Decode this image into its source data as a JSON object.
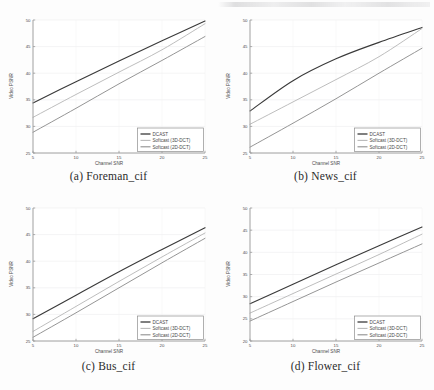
{
  "figure": {
    "type": "multi-panel-line-chart-figure",
    "panel_count": 4,
    "layout": "2x2"
  },
  "captions": {
    "a": "(a) Foreman_cif",
    "b": "(b) News_cif",
    "c": "(c) Bus_cif",
    "d": "(d) Flower_cif"
  },
  "common": {
    "xlabel": "Channel SNR",
    "ylabel": "Video PSNR",
    "xticks": [
      "5",
      "10",
      "15",
      "20",
      "25"
    ],
    "legend": [
      "DCAST",
      "Softcast (3D-DCT)",
      "Softcast (2D-DCT)"
    ]
  },
  "colors": {
    "dcast": "#3a3a3a",
    "softcast_3d": "#b9b9b9",
    "softcast_2d": "#8f8f8f",
    "axis": "#9a9a9a",
    "grid": "#e8e8ea",
    "text": "#4a4a4a",
    "caption": "#2b2b2b",
    "background": "#fdfdfd"
  },
  "chart_data": [
    {
      "type": "line",
      "panel": "a",
      "title": "(a) Foreman_cif",
      "xlabel": "Channel SNR",
      "ylabel": "Video PSNR",
      "xlim": [
        5,
        25
      ],
      "ylim": [
        25,
        50
      ],
      "xticks": [
        5,
        10,
        15,
        20,
        25
      ],
      "yticks": [
        25,
        30,
        35,
        40,
        45,
        50
      ],
      "grid": true,
      "legend_position": "lower right",
      "x": [
        5,
        10,
        15,
        20,
        25
      ],
      "series": [
        {
          "name": "DCAST",
          "values": [
            34.4,
            38.4,
            42.3,
            46.1,
            49.8
          ]
        },
        {
          "name": "Softcast (3D-DCT)",
          "values": [
            31.7,
            36.0,
            40.2,
            44.4,
            49.3
          ]
        },
        {
          "name": "Softcast (2D-DCT)",
          "values": [
            28.9,
            33.4,
            38.0,
            42.4,
            46.9
          ]
        }
      ]
    },
    {
      "type": "line",
      "panel": "b",
      "title": "(b) News_cif",
      "xlabel": "Channel SNR",
      "ylabel": "Video PSNR",
      "xlim": [
        5,
        25
      ],
      "ylim": [
        25,
        50
      ],
      "xticks": [
        5,
        10,
        15,
        20,
        25
      ],
      "yticks": [
        25,
        30,
        35,
        40,
        45,
        50
      ],
      "grid": true,
      "legend_position": "lower right",
      "x": [
        5,
        10,
        15,
        20,
        25
      ],
      "series": [
        {
          "name": "DCAST",
          "values": [
            32.9,
            38.6,
            42.7,
            45.8,
            48.6
          ]
        },
        {
          "name": "Softcast (3D-DCT)",
          "values": [
            30.4,
            34.6,
            38.8,
            43.1,
            48.4
          ]
        },
        {
          "name": "Softcast (2D-DCT)",
          "values": [
            26.1,
            30.6,
            35.2,
            40.0,
            44.7
          ]
        }
      ]
    },
    {
      "type": "line",
      "panel": "c",
      "title": "(c) Bus_cif",
      "xlabel": "Channel SNR",
      "ylabel": "Video PSNR",
      "xlim": [
        5,
        25
      ],
      "ylim": [
        25,
        50
      ],
      "xticks": [
        5,
        10,
        15,
        20,
        25
      ],
      "yticks": [
        25,
        30,
        35,
        40,
        45,
        50
      ],
      "grid": true,
      "legend_position": "lower right",
      "x": [
        5,
        10,
        15,
        20,
        25
      ],
      "series": [
        {
          "name": "DCAST",
          "values": [
            29.2,
            33.6,
            38.0,
            42.2,
            46.3
          ]
        },
        {
          "name": "Softcast (3D-DCT)",
          "values": [
            26.8,
            31.5,
            36.2,
            40.8,
            45.3
          ]
        },
        {
          "name": "Softcast (2D-DCT)",
          "values": [
            25.7,
            30.3,
            35.0,
            39.7,
            44.3
          ]
        }
      ]
    },
    {
      "type": "line",
      "panel": "d",
      "title": "(d) Flower_cif",
      "xlabel": "Channel SNR",
      "ylabel": "Video PSNR",
      "xlim": [
        5,
        25
      ],
      "ylim": [
        20,
        50
      ],
      "xticks": [
        5,
        10,
        15,
        20,
        25
      ],
      "yticks": [
        20,
        25,
        30,
        35,
        40,
        45,
        50
      ],
      "grid": true,
      "legend_position": "lower right",
      "x": [
        5,
        10,
        15,
        20,
        25
      ],
      "series": [
        {
          "name": "DCAST",
          "values": [
            28.4,
            32.8,
            37.2,
            41.5,
            45.7
          ]
        },
        {
          "name": "Softcast (3D-DCT)",
          "values": [
            26.3,
            30.7,
            35.1,
            39.5,
            44.1
          ]
        },
        {
          "name": "Softcast (2D-DCT)",
          "values": [
            24.5,
            28.9,
            33.3,
            37.6,
            41.9
          ]
        }
      ]
    }
  ]
}
